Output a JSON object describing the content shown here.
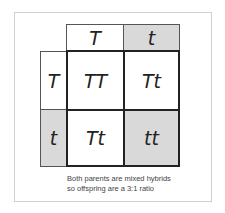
{
  "diagram": {
    "type": "punnett-square",
    "top_alleles": [
      "T",
      "t"
    ],
    "left_alleles": [
      "T",
      "t"
    ],
    "offspring": [
      [
        "TT",
        "Tt"
      ],
      [
        "Tt",
        "tt"
      ]
    ],
    "shaded_color": "#d9d9d9",
    "caption": {
      "line1": "Both parents are mixed hybrids",
      "line2": "so offspring are a 3:1 ratio"
    }
  }
}
